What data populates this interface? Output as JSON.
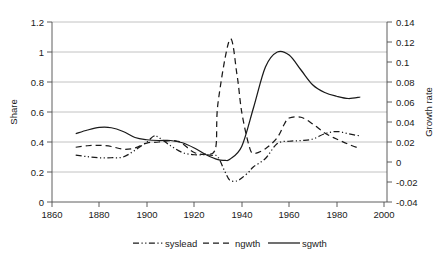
{
  "chart_data": {
    "type": "line",
    "title": "",
    "xlabel": "",
    "ylabel": "Share",
    "y2label": "Growth rate",
    "xlim": [
      1860,
      2000
    ],
    "ylim": [
      0,
      1.2
    ],
    "y2lim": [
      -0.04,
      0.14
    ],
    "xticks": [
      1860,
      1880,
      1900,
      1920,
      1940,
      1960,
      1980,
      2000
    ],
    "xtick_labels": [
      "1860",
      "1880",
      "1900",
      "1920",
      "1940",
      "1960",
      "1980",
      "2000"
    ],
    "yticks": [
      0,
      0.2,
      0.4,
      0.6,
      0.8,
      1,
      1.2
    ],
    "ytick_labels": [
      "0",
      "0.2",
      "0.4",
      "0.6",
      "0.8",
      "1",
      "1.2"
    ],
    "y2ticks": [
      -0.04,
      -0.02,
      0,
      0.02,
      0.04,
      0.06,
      0.08,
      0.1,
      0.12,
      0.14
    ],
    "y2tick_labels": [
      "-0.04",
      "-0.02",
      "0",
      "0.02",
      "0.04",
      "0.06",
      "0.08",
      "0.1",
      "0.12",
      "0.14"
    ],
    "grid": true,
    "legend_position": "bottom",
    "series": [
      {
        "name": "syslead",
        "axis": "left",
        "style": "dash-dot-dot",
        "x": [
          1870,
          1875,
          1880,
          1885,
          1890,
          1895,
          1900,
          1903,
          1905,
          1910,
          1915,
          1920,
          1925,
          1928,
          1930,
          1933,
          1935,
          1938,
          1940,
          1943,
          1945,
          1950,
          1955,
          1960,
          1965,
          1970,
          1975,
          1980,
          1985,
          1990
        ],
        "y": [
          0.312,
          0.302,
          0.295,
          0.295,
          0.3,
          0.345,
          0.4,
          0.44,
          0.43,
          0.375,
          0.33,
          0.315,
          0.315,
          0.31,
          0.3,
          0.2,
          0.145,
          0.14,
          0.16,
          0.2,
          0.235,
          0.29,
          0.39,
          0.405,
          0.41,
          0.42,
          0.455,
          0.47,
          0.455,
          0.44
        ]
      },
      {
        "name": "ngwth",
        "axis": "left",
        "style": "dashed",
        "x": [
          1870,
          1875,
          1880,
          1885,
          1890,
          1895,
          1900,
          1905,
          1910,
          1913,
          1915,
          1920,
          1925,
          1929,
          1930,
          1935,
          1938,
          1940,
          1943,
          1945,
          1950,
          1955,
          1958,
          1960,
          1965,
          1970,
          1975,
          1980,
          1985,
          1990
        ],
        "y": [
          0.365,
          0.375,
          0.378,
          0.37,
          0.352,
          0.36,
          0.393,
          0.4,
          0.41,
          0.405,
          0.39,
          0.33,
          0.32,
          0.36,
          0.66,
          1.085,
          0.85,
          0.6,
          0.38,
          0.325,
          0.355,
          0.43,
          0.52,
          0.56,
          0.565,
          0.52,
          0.46,
          0.42,
          0.385,
          0.355
        ]
      },
      {
        "name": "sgwth",
        "axis": "left",
        "style": "solid",
        "x": [
          1870,
          1875,
          1880,
          1885,
          1890,
          1895,
          1900,
          1905,
          1910,
          1915,
          1920,
          1925,
          1930,
          1933,
          1935,
          1940,
          1945,
          1950,
          1955,
          1960,
          1965,
          1970,
          1975,
          1980,
          1985,
          1990
        ],
        "y": [
          0.455,
          0.48,
          0.497,
          0.495,
          0.47,
          0.43,
          0.415,
          0.41,
          0.41,
          0.395,
          0.36,
          0.315,
          0.282,
          0.278,
          0.285,
          0.37,
          0.63,
          0.9,
          1.0,
          0.98,
          0.88,
          0.78,
          0.73,
          0.705,
          0.69,
          0.7
        ]
      }
    ]
  },
  "legend": {
    "items": [
      {
        "label": "syslead",
        "style": "dash-dot-dot"
      },
      {
        "label": "ngwth",
        "style": "dashed"
      },
      {
        "label": "sgwth",
        "style": "solid"
      }
    ]
  }
}
